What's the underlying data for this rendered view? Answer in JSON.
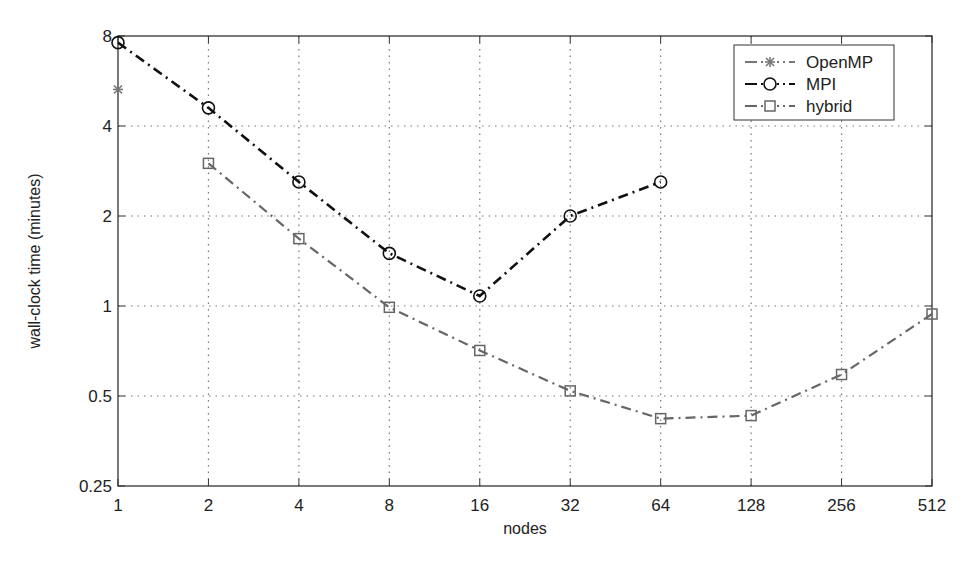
{
  "chart_data": {
    "type": "line",
    "title": "",
    "xlabel": "nodes",
    "ylabel": "wall-clock time (minutes)",
    "x_scale": "log2",
    "y_scale": "log2",
    "x_ticks": [
      "1",
      "2",
      "4",
      "8",
      "16",
      "32",
      "64",
      "128",
      "256",
      "512"
    ],
    "y_ticks": [
      "0.25",
      "0.5",
      "1",
      "2",
      "4",
      "8"
    ],
    "xlim": [
      1,
      512
    ],
    "ylim": [
      0.25,
      8
    ],
    "grid": true,
    "legend_position": "upper right",
    "series": [
      {
        "name": "OpenMP",
        "marker": "*",
        "linestyle": "-.",
        "color": "#777777",
        "x": [
          1
        ],
        "values": [
          5.3
        ]
      },
      {
        "name": "MPI",
        "marker": "o",
        "linestyle": "-.",
        "color": "#111111",
        "x": [
          1,
          2,
          4,
          8,
          16,
          32,
          64
        ],
        "values": [
          7.6,
          4.6,
          2.6,
          1.5,
          1.08,
          2.0,
          2.6
        ]
      },
      {
        "name": "hybrid",
        "marker": "s",
        "linestyle": "-.",
        "color": "#666666",
        "x": [
          2,
          4,
          8,
          16,
          32,
          64,
          128,
          256,
          512
        ],
        "values": [
          3.0,
          1.68,
          0.99,
          0.71,
          0.52,
          0.42,
          0.43,
          0.59,
          0.94
        ]
      }
    ]
  }
}
